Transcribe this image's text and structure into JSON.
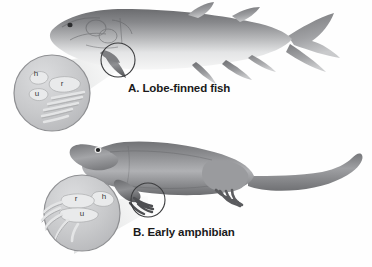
{
  "figure": {
    "background_color": "#fefefe",
    "style": "grayscale scientific illustration",
    "caption_color": "#1a1a1a"
  },
  "panels": [
    {
      "id": "A",
      "caption": "A. Lobe-finned fish",
      "organism": "lobe-finned fish",
      "callout": {
        "type": "magnifier-circle",
        "target": "pectoral lobe fin",
        "inset_labels": [
          {
            "text": "h",
            "meaning": "humerus"
          },
          {
            "text": "r",
            "meaning": "radius"
          },
          {
            "text": "u",
            "meaning": "ulna"
          }
        ]
      }
    },
    {
      "id": "B",
      "caption": "B. Early amphibian",
      "organism": "early amphibian",
      "callout": {
        "type": "magnifier-circle",
        "target": "forelimb",
        "inset_labels": [
          {
            "text": "r",
            "meaning": "radius"
          },
          {
            "text": "h",
            "meaning": "humerus"
          },
          {
            "text": "u",
            "meaning": "ulna"
          }
        ]
      }
    }
  ],
  "colors": {
    "body_dark": "#6f7073",
    "body_mid": "#9a9b9e",
    "body_light": "#d9dadc",
    "body_highlight": "#f2f2f3",
    "inset_fill": "#c9cacc",
    "inset_stroke": "#8e8f92",
    "bone_fill": "#e6e7e8",
    "outline": "#4a4b4d",
    "cone_fill": "#eceded"
  }
}
